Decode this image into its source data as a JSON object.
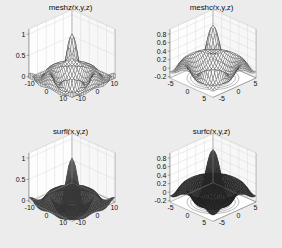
{
  "figure": {
    "background": "#ececed",
    "layout": "2x2",
    "width": 282,
    "height": 248
  },
  "panels": [
    {
      "id": "meshz",
      "title": "meshz(x,y,z)",
      "style": "mesh-with-skirt",
      "line_color": "#2b2b2b",
      "face_color": "#ffffff",
      "skirt": true,
      "contour": false,
      "shaded": false,
      "z_ticks": [
        "1",
        "0.5",
        "0"
      ],
      "z_values": [
        1,
        0.5,
        0
      ],
      "x_ticks": [
        "-10",
        "0",
        "10"
      ],
      "y_ticks": [
        "-10",
        "0",
        "10"
      ],
      "axis_limit": 10
    },
    {
      "id": "meshc",
      "title": "meshc(x,y,z)",
      "style": "mesh-with-contour",
      "line_color": "#2b2b2b",
      "face_color": "#ffffff",
      "skirt": false,
      "contour": true,
      "shaded": false,
      "z_ticks": [
        "0.8",
        "0.6",
        "0.4",
        "0.2",
        "0",
        "-0.2"
      ],
      "z_values": [
        0.8,
        0.6,
        0.4,
        0.2,
        0,
        -0.2
      ],
      "x_ticks": [
        "-5",
        "0",
        "5"
      ],
      "y_ticks": [
        "-5",
        "0",
        "5"
      ],
      "axis_limit": 8
    },
    {
      "id": "surfl",
      "title": "surfl(x,y,z)",
      "style": "lit-surface",
      "line_color": "#1c1c1c",
      "face_color": "#3a3a3a",
      "skirt": false,
      "contour": false,
      "shaded": true,
      "z_ticks": [
        "1",
        "0.5",
        "0"
      ],
      "z_values": [
        1,
        0.5,
        0
      ],
      "x_ticks": [
        "-10",
        "0",
        "10"
      ],
      "y_ticks": [
        "-10",
        "0",
        "10"
      ],
      "axis_limit": 10
    },
    {
      "id": "surfc",
      "title": "surfc(x,y,z)",
      "style": "surface-with-contour",
      "line_color": "#141414",
      "face_color": "#262626",
      "skirt": false,
      "contour": true,
      "shaded": true,
      "z_ticks": [
        "0.8",
        "0.6",
        "0.4",
        "0.2",
        "0",
        "-0.2"
      ],
      "z_values": [
        0.8,
        0.6,
        0.4,
        0.2,
        0,
        -0.2
      ],
      "x_ticks": [
        "-5",
        "0",
        "5"
      ],
      "y_ticks": [
        "-5",
        "0",
        "5"
      ],
      "axis_limit": 8
    }
  ],
  "chart_data": {
    "type": "surface",
    "subplots": 4,
    "function": "z = sin(r)/r  (sombrero / sinc surface)",
    "formula_note": "r = sqrt(x^2 + y^2), z = sin(r)/r",
    "xlabel": "x",
    "ylabel": "y",
    "zlabel": "z",
    "grid": true,
    "legend": "none",
    "view_azimuth": -37.5,
    "view_elevation": 30,
    "mesh_resolution": 30,
    "series": [
      {
        "name": "meshz(x,y,z)",
        "plot_type": "meshz",
        "description": "Wireframe mesh with a vertical curtain/skirt dropped to the base plane",
        "xlim": [
          -10,
          10
        ],
        "ylim": [
          -10,
          10
        ],
        "zlim": [
          -0.25,
          1.05
        ],
        "x_ticks": [
          -10,
          0,
          10
        ],
        "y_ticks": [
          -10,
          0,
          10
        ],
        "z_ticks": [
          0,
          0.5,
          1
        ],
        "peak_value": 1.0,
        "min_value": -0.22
      },
      {
        "name": "meshc(x,y,z)",
        "plot_type": "meshc",
        "description": "Wireframe mesh with contour plot drawn beneath the surface",
        "xlim": [
          -8,
          8
        ],
        "ylim": [
          -8,
          8
        ],
        "zlim": [
          -0.3,
          0.9
        ],
        "x_ticks": [
          -5,
          0,
          5
        ],
        "y_ticks": [
          -5,
          0,
          5
        ],
        "z_ticks": [
          -0.2,
          0,
          0.2,
          0.4,
          0.6,
          0.8
        ],
        "peak_value": 0.9,
        "min_value": -0.22,
        "contour_levels": [
          -0.2,
          -0.1,
          0,
          0.1,
          0.2,
          0.3,
          0.4
        ]
      },
      {
        "name": "surfl(x,y,z)",
        "plot_type": "surfl",
        "description": "Shaded surface with directional lighting, dark colormap",
        "xlim": [
          -10,
          10
        ],
        "ylim": [
          -10,
          10
        ],
        "zlim": [
          -0.25,
          1.05
        ],
        "x_ticks": [
          -10,
          0,
          10
        ],
        "y_ticks": [
          -10,
          0,
          10
        ],
        "z_ticks": [
          0,
          0.5,
          1
        ],
        "peak_value": 1.0,
        "min_value": -0.22
      },
      {
        "name": "surfc(x,y,z)",
        "plot_type": "surfc",
        "description": "Shaded surface with contour plot drawn beneath the surface",
        "xlim": [
          -8,
          8
        ],
        "ylim": [
          -8,
          8
        ],
        "zlim": [
          -0.3,
          0.9
        ],
        "x_ticks": [
          -5,
          0,
          5
        ],
        "y_ticks": [
          -5,
          0,
          5
        ],
        "z_ticks": [
          -0.2,
          0,
          0.2,
          0.4,
          0.6,
          0.8
        ],
        "peak_value": 0.9,
        "min_value": -0.22,
        "contour_levels": [
          -0.2,
          -0.1,
          0,
          0.1,
          0.2,
          0.3,
          0.4
        ]
      }
    ]
  }
}
